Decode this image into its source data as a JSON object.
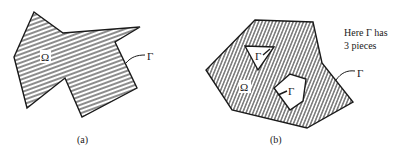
{
  "figure": {
    "panels": [
      {
        "id": "a",
        "caption": "(a)",
        "region_label": "Ω",
        "boundary_label": "Γ",
        "outline": [
          [
            34,
            12
          ],
          [
            63,
            33
          ],
          [
            140,
            27
          ],
          [
            115,
            42
          ],
          [
            137,
            88
          ],
          [
            82,
            117
          ],
          [
            65,
            78
          ],
          [
            27,
            108
          ],
          [
            14,
            57
          ]
        ],
        "hatch": "horizontal-slanted"
      },
      {
        "id": "b",
        "caption": "(b)",
        "region_label": "Ω",
        "boundary_label": "Γ",
        "hole_labels": [
          "Γ",
          "Γ"
        ],
        "outline": [
          [
            255,
            20
          ],
          [
            313,
            22
          ],
          [
            322,
            63
          ],
          [
            353,
            102
          ],
          [
            307,
            128
          ],
          [
            232,
            110
          ],
          [
            206,
            70
          ]
        ],
        "holes": [
          [
            [
              245,
              46
            ],
            [
              274,
              47
            ],
            [
              258,
              70
            ]
          ],
          [
            [
              274,
              88
            ],
            [
              290,
              74
            ],
            [
              306,
              79
            ],
            [
              303,
              101
            ],
            [
              290,
              110
            ]
          ]
        ],
        "hatch": "steep-slanted",
        "note_line1": "Here Γ has",
        "note_line2": "3 pieces"
      }
    ],
    "colors": {
      "ink": "#1a1a1a",
      "background": "#ffffff"
    }
  }
}
